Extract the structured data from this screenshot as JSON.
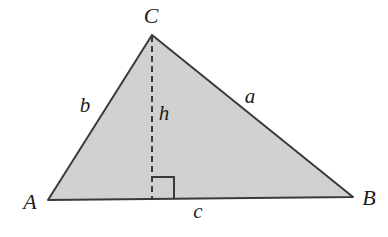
{
  "figure": {
    "type": "geometry-diagram",
    "background_color": "#ffffff",
    "fill_color": "#d2d2d2",
    "stroke_color": "#3a3a3a",
    "label_color": "#1d1d1d"
  },
  "vertices": [
    {
      "id": "A",
      "label": "A",
      "x": 48,
      "y": 200,
      "label_x": 30,
      "label_y": 202
    },
    {
      "id": "B",
      "label": "B",
      "x": 353,
      "y": 197,
      "label_x": 369,
      "label_y": 198
    },
    {
      "id": "C",
      "label": "C",
      "x": 152,
      "y": 35,
      "label_x": 151,
      "label_y": 16
    }
  ],
  "sides": [
    {
      "id": "a",
      "label": "a",
      "from": "C",
      "to": "B",
      "label_x": 250,
      "label_y": 96
    },
    {
      "id": "b",
      "label": "b",
      "from": "A",
      "to": "C",
      "label_x": 85,
      "label_y": 105
    },
    {
      "id": "c",
      "label": "c",
      "from": "A",
      "to": "B",
      "label_x": 198,
      "label_y": 211
    }
  ],
  "altitude": {
    "id": "h",
    "label": "h",
    "from_x": 152,
    "from_y": 36,
    "to_x": 152,
    "to_y": 199,
    "label_x": 164,
    "label_y": 113,
    "style": "dashed",
    "dash_pattern": "6 4"
  },
  "right_angle_marker": {
    "name": "right-angle-marker",
    "corner_x": 152,
    "corner_y": 199,
    "size": 22,
    "direction": "right"
  }
}
